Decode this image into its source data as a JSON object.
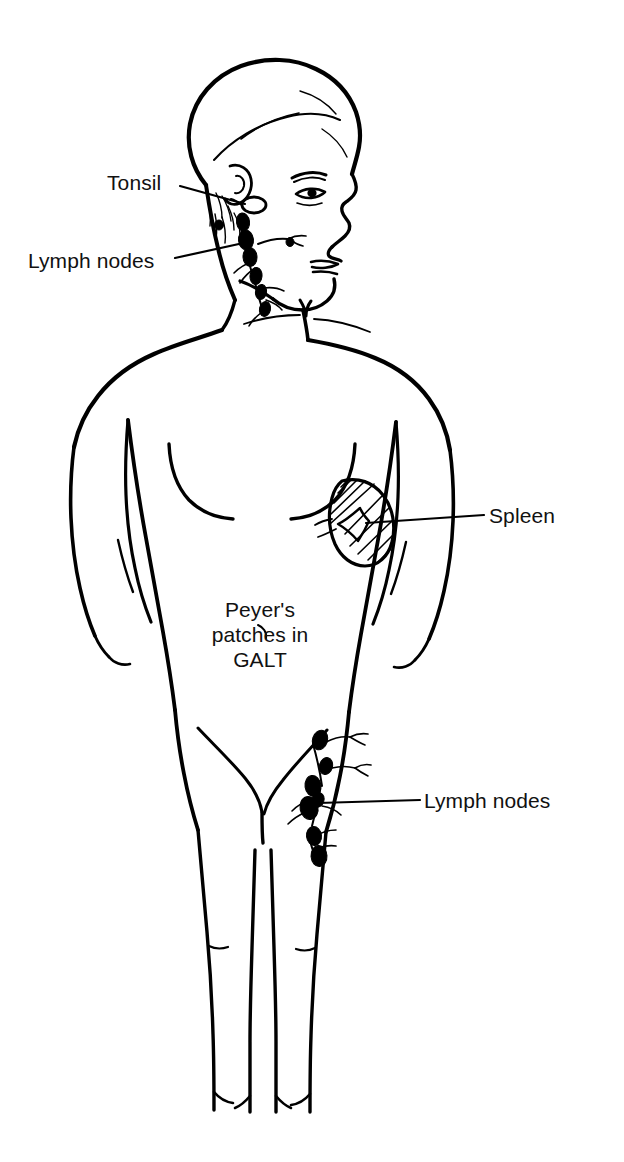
{
  "figure": {
    "kind": "anatomical-line-drawing",
    "line_color": "#000000",
    "background_color": "#ffffff"
  },
  "labels": [
    {
      "id": "tonsil",
      "text": "Tonsil",
      "leader": "line-to-tonsil-oval"
    },
    {
      "id": "lymph_upper",
      "text": "Lymph nodes",
      "leader": "line-to-cervical-chain"
    },
    {
      "id": "spleen",
      "text": "Spleen",
      "leader": "line-to-spleen"
    },
    {
      "id": "galt",
      "text": "Peyer's patches in GALT",
      "leader": "none"
    },
    {
      "id": "lymph_lower",
      "text": "Lymph nodes",
      "leader": "line-to-inguinal-chain"
    }
  ],
  "galt_lines": [
    "Peyer's",
    "patches in",
    "GALT"
  ],
  "organs": [
    {
      "name": "tonsil",
      "style": "small open oval"
    },
    {
      "name": "cervical-lymph-nodes",
      "style": "chain of filled blobs"
    },
    {
      "name": "spleen",
      "style": "hatched bean shape"
    },
    {
      "name": "inguinal-lymph-nodes",
      "style": "chain of filled blobs"
    }
  ]
}
